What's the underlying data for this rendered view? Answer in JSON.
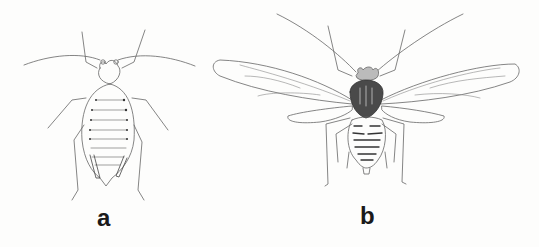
{
  "figures": [
    {
      "id": "a",
      "label": "a",
      "subject": "wingless aphid (apterous form), dorsal view"
    },
    {
      "id": "b",
      "label": "b",
      "subject": "winged aphid (alate form), dorsal view"
    }
  ],
  "colors": {
    "background": "#fdfdfc",
    "line": "#555555",
    "dark_shading": "#333333",
    "label": "#1a1a1a"
  }
}
